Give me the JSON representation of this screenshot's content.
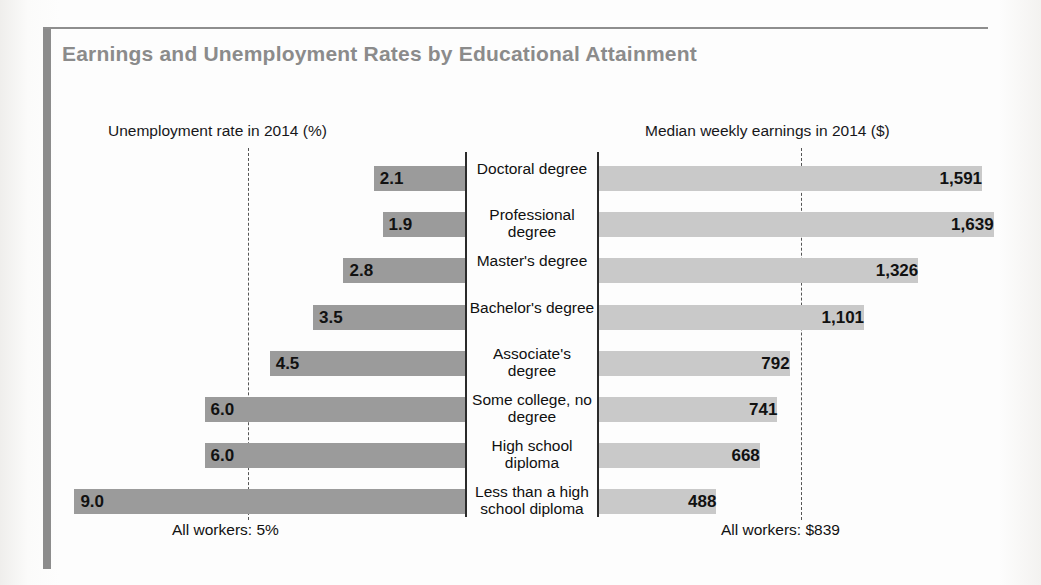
{
  "title": "Earnings and Unemployment Rates by Educational Attainment",
  "headers": {
    "left": "Unemployment rate in 2014 (%)",
    "right": "Median weekly earnings in 2014 ($)"
  },
  "footnotes": {
    "left": "All workers: 5%",
    "right": "All workers: $839"
  },
  "colors": {
    "title": "#8b8b8b",
    "bar_left": "#9b9b9b",
    "bar_right": "#c9c9c9",
    "axis": "#2b2b2b",
    "rule": "#8c8c8c"
  },
  "chart_data": {
    "type": "bar",
    "title": "Earnings and Unemployment Rates by Educational Attainment",
    "orientation": "horizontal-diverging",
    "categories": [
      "Doctoral degree",
      "Professional degree",
      "Master's degree",
      "Bachelor's degree",
      "Associate's degree",
      "Some college, no degree",
      "High school diploma",
      "Less than a high school diploma"
    ],
    "series": [
      {
        "name": "Unemployment rate in 2014 (%)",
        "side": "left",
        "unit": "%",
        "values": [
          2.1,
          1.9,
          2.8,
          3.5,
          4.5,
          6.0,
          6.0,
          9.0
        ],
        "labels": [
          "2.1",
          "1.9",
          "2.8",
          "3.5",
          "4.5",
          "6.0",
          "6.0",
          "9.0"
        ],
        "reference_line": {
          "value": 5,
          "label": "All workers: 5%"
        },
        "axis_max": 9.0
      },
      {
        "name": "Median weekly earnings in 2014 ($)",
        "side": "right",
        "unit": "$",
        "values": [
          1591,
          1639,
          1326,
          1101,
          792,
          741,
          668,
          488
        ],
        "labels": [
          "1,591",
          "1,639",
          "1,326",
          "1,101",
          "792",
          "741",
          "668",
          "488"
        ],
        "reference_line": {
          "value": 839,
          "label": "All workers: $839"
        },
        "axis_max": 1639
      }
    ],
    "grid": false,
    "legend": "none"
  }
}
